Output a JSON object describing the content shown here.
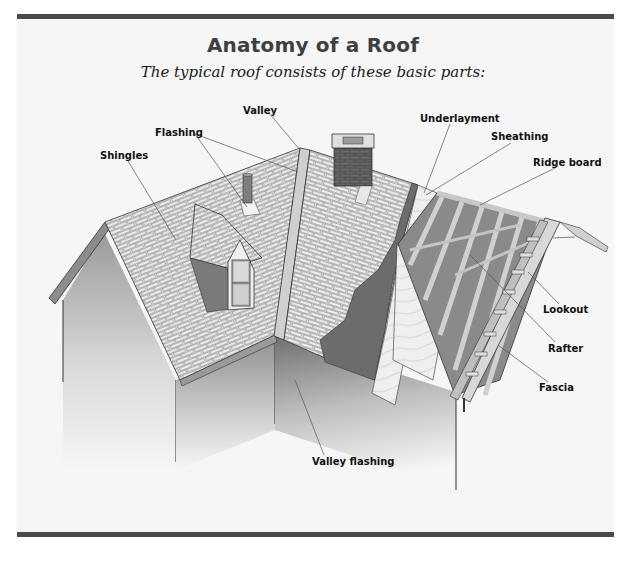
{
  "header": {
    "title": "Anatomy of a Roof",
    "subtitle": "The typical roof consists of these basic parts:"
  },
  "labels": {
    "valley": "Valley",
    "flashing": "Flashing",
    "shingles": "Shingles",
    "underlayment": "Underlayment",
    "sheathing": "Sheathing",
    "ridge_board": "Ridge board",
    "lookout": "Lookout",
    "rafter": "Rafter",
    "fascia": "Fascia",
    "valley_flashing": "Valley flashing"
  },
  "colors": {
    "frame_bar": "#4a4a4a",
    "panel_bg": "#f6f6f6",
    "shingle": "#d6d6d6",
    "underlayment": "#6e6e6e",
    "sheathing": "#ececec",
    "rafter": "#bdbdbd",
    "chimney": "#5c5c5c"
  }
}
